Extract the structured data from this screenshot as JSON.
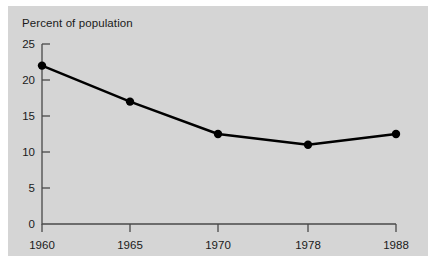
{
  "chart_data": {
    "type": "line",
    "title": "Percent of population",
    "xlabel": "",
    "ylabel": "",
    "categories": [
      "1960",
      "1965",
      "1970",
      "1978",
      "1988"
    ],
    "values": [
      22,
      17,
      12.5,
      11,
      12.5
    ],
    "series": [
      {
        "name": "Percent of population",
        "values": [
          22,
          17,
          12.5,
          11,
          12.5
        ]
      }
    ],
    "ylim": [
      0,
      25
    ],
    "yticks": [
      0,
      5,
      10,
      15,
      20,
      25
    ],
    "ytick_labels": [
      "0",
      "5",
      "10",
      "15",
      "20",
      "25"
    ],
    "xtick_labels": [
      "1960",
      "1965",
      "1970",
      "1978",
      "1988"
    ],
    "grid": false,
    "legend": false,
    "marker": "filled-circle",
    "line_color": "#000000",
    "panel_color": "#d5d5d5",
    "axis_color": "#4a4a4a"
  },
  "axis": {
    "y_label_0": "0",
    "y_label_1": "5",
    "y_label_2": "10",
    "y_label_3": "15",
    "y_label_4": "20",
    "y_label_5": "25",
    "x_label_0": "1960",
    "x_label_1": "1965",
    "x_label_2": "1970",
    "x_label_3": "1978",
    "x_label_4": "1988"
  }
}
